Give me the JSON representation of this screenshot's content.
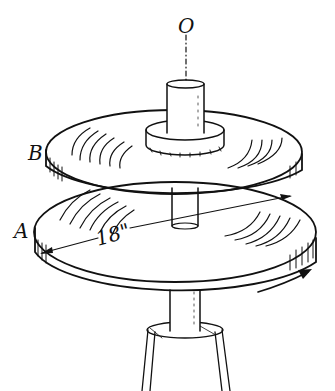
{
  "figure": {
    "labels": {
      "axis": "O",
      "upper_disc": "B",
      "lower_disc": "A"
    },
    "dimension": {
      "text": "18\"",
      "refers_to": "diameter of disc A"
    },
    "rotation_arrow": "clockwise-arrow",
    "colors": {
      "ink": "#111111",
      "background": "#ffffff"
    }
  }
}
